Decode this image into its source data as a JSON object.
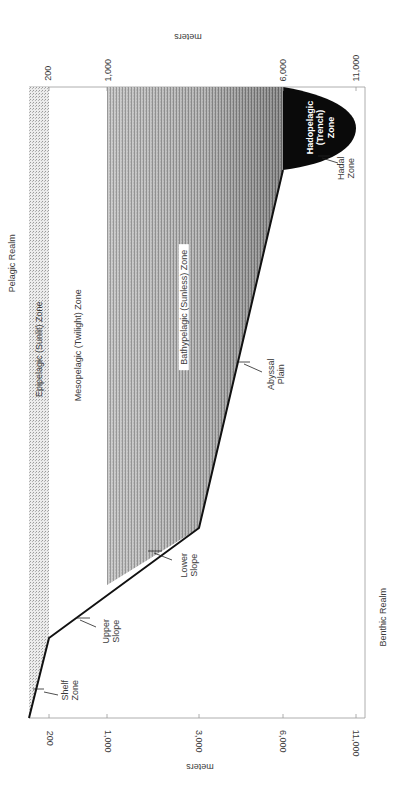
{
  "diagram": {
    "orientation": "rotated 90 degrees; depth axis runs horizontally",
    "axis": {
      "unit_label": "meters",
      "ticks": [
        "200",
        "1,000",
        "3,000",
        "6,000",
        "11,000"
      ],
      "top_ticks": [
        "200",
        "1,000",
        "6,000",
        "11,000"
      ]
    },
    "realms": {
      "pelagic": "Pelagic Realm",
      "benthic": "Benthic Realm"
    },
    "pelagic_zones": [
      {
        "name": "Epipelagic (Sunlit) Zone",
        "depth_range": "0-200"
      },
      {
        "name": "Mesopelagic (Twilight) Zone",
        "depth_range": "200-1,000"
      },
      {
        "name": "Bathypelagic (Sunless) Zone",
        "depth_range": "1,000-6,000"
      },
      {
        "name_line1": "Hadopelagic",
        "name_line2": "(Trench)",
        "name_line3": "Zone",
        "depth_range": "6,000-11,000"
      }
    ],
    "benthic_zones": [
      {
        "line1": "Shelf",
        "line2": "Zone"
      },
      {
        "line1": "Upper",
        "line2": "Slope"
      },
      {
        "line1": "Lower",
        "line2": "Slope"
      },
      {
        "line1": "Abyssal",
        "line2": "Plain"
      },
      {
        "line1": "Hadal",
        "line2": "Zone"
      }
    ],
    "colors": {
      "seafloor_line": "#111111",
      "trench_fill": "#0a0a0a",
      "epipelagic_fill": "#d9d9d9",
      "bathypelagic_light": "#d4d4d4",
      "bathypelagic_dark": "#5a5a5a",
      "frame": "#9a9a9a"
    }
  }
}
